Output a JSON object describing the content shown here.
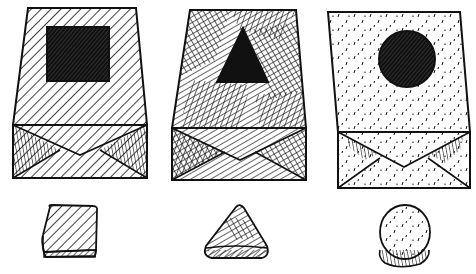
{
  "illustration": {
    "description": "Three pen-and-ink drawings of paper bags, each with a shape cutout on the front, and below each bag a matching 3D shape",
    "ink_color": "#111111",
    "paper_color": "#ffffff",
    "bags": [
      {
        "id": "bag-square",
        "texture": "diagonal-hatching",
        "cutout_shape": "square",
        "cutout_fill": "crosshatched-dark",
        "body": {
          "top": [
            [
              28,
              8
            ],
            [
              136,
              8
            ]
          ],
          "bottom": [
            [
              13,
              125
            ],
            [
              147,
              125
            ]
          ]
        },
        "flap": {
          "top_y": 125,
          "bottom_y": 178,
          "left_x": 13,
          "right_x": 147,
          "v_point": [
            80,
            155
          ]
        },
        "cutout": {
          "x": 47,
          "y": 27,
          "w": 62,
          "h": 54
        }
      },
      {
        "id": "bag-triangle",
        "texture": "patchy-crosshatching",
        "cutout_shape": "triangle",
        "cutout_fill": "solid-black",
        "body": {
          "top": [
            [
              190,
              10
            ],
            [
              296,
              10
            ]
          ],
          "bottom": [
            [
              172,
              128
            ],
            [
              306,
              128
            ]
          ]
        },
        "flap": {
          "top_y": 128,
          "bottom_y": 180,
          "left_x": 172,
          "right_x": 306,
          "v_point": [
            240,
            160
          ]
        },
        "cutout": {
          "points": [
            [
              243,
              28
            ],
            [
              217,
              82
            ],
            [
              268,
              82
            ]
          ]
        }
      },
      {
        "id": "bag-circle",
        "texture": "stipple-dashes",
        "cutout_shape": "circle",
        "cutout_fill": "crosshatched-dark",
        "body": {
          "top": [
            [
              328,
              12
            ],
            [
              460,
              12
            ]
          ],
          "bottom": [
            [
              338,
              132
            ],
            [
              470,
              132
            ]
          ]
        },
        "flap": {
          "top_y": 132,
          "bottom_y": 188,
          "left_x": 338,
          "right_x": 470,
          "v_point": [
            404,
            167
          ]
        },
        "cutout": {
          "cx": 407,
          "cy": 59,
          "r": 28
        }
      }
    ],
    "objects": [
      {
        "id": "cube",
        "shape": "rounded-cube",
        "texture": "diagonal-hatching",
        "bbox": {
          "x": 40,
          "y": 204,
          "w": 60,
          "h": 60
        }
      },
      {
        "id": "pyramid",
        "shape": "rounded-triangular-pyramid",
        "texture": "crosshatching",
        "bbox": {
          "x": 202,
          "y": 204,
          "w": 66,
          "h": 60
        }
      },
      {
        "id": "disc",
        "shape": "cylinder-disc",
        "texture": "stipple-dashes",
        "bbox": {
          "x": 376,
          "y": 206,
          "w": 56,
          "h": 60
        }
      }
    ]
  }
}
